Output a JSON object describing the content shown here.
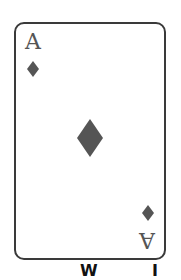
{
  "card": {
    "rank": "A",
    "suit": "diamonds",
    "suit_icon": "diamond-icon",
    "colors": {
      "border": "#3a3a3a",
      "pip": "#555555",
      "rank_text": "#555555",
      "face": "#ffffff"
    }
  },
  "caption": {
    "left_fragment": "W",
    "right_fragment": "I"
  }
}
